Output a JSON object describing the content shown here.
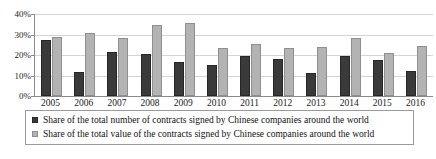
{
  "chart_data": {
    "type": "bar",
    "title": "",
    "subtitle": "",
    "xlabel": "",
    "ylabel": "",
    "ylim": [
      0,
      40
    ],
    "ytick_labels": [
      "0%",
      "10%",
      "20%",
      "30%",
      "40%"
    ],
    "ytick_values": [
      0,
      10,
      20,
      30,
      40
    ],
    "grid": true,
    "legend_position": "bottom",
    "categories": [
      "2005",
      "2006",
      "2007",
      "2008",
      "2009",
      "2010",
      "2011",
      "2012",
      "2013",
      "2014",
      "2015",
      "2016"
    ],
    "series": [
      {
        "name": "Share of the total number of contracts signed by Chinese companies around the world",
        "color": "#3a3a3a",
        "values": [
          27.5,
          11.8,
          21.6,
          20.7,
          16.5,
          15.1,
          19.6,
          17.9,
          11.3,
          19.7,
          17.5,
          12.2
        ]
      },
      {
        "name": "Share of the total value of the contracts signed by Chinese companies around the world",
        "color": "#b3b3b3",
        "values": [
          28.9,
          30.8,
          28.4,
          34.8,
          35.6,
          23.4,
          25.2,
          23.4,
          23.8,
          28.3,
          20.8,
          24.5
        ]
      }
    ]
  },
  "legend": {
    "items": [
      {
        "marker": "legend-swatch-dark",
        "label": "Share of the total number of contracts signed by Chinese companies around the world"
      },
      {
        "marker": "legend-swatch-light",
        "label": "Share of the total value of the contracts signed by Chinese companies around the world"
      }
    ]
  }
}
